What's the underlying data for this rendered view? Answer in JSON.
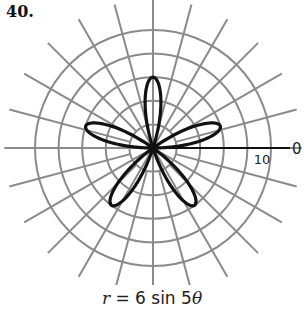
{
  "problem": {
    "number": "40."
  },
  "caption": {
    "lhs": "r",
    "equals": " = 6 sin 5",
    "theta": "θ"
  },
  "axis_labels": {
    "zero_angle": "0",
    "radius_tick": "10"
  },
  "colors": {
    "grid": "#8a8a8a",
    "curve": "#111111",
    "axis": "#111111"
  },
  "chart_data": {
    "type": "polar",
    "title": "r = 6 sin 5θ",
    "equation": {
      "a": 6,
      "k": 5,
      "function": "sin"
    },
    "petals": 5,
    "max_radius": 6,
    "grid": {
      "circles": [
        2,
        4,
        6,
        8,
        10
      ],
      "ray_step_degrees": 15,
      "ray_count": 24
    },
    "labels": [
      {
        "text": "0",
        "position": "angle 0 axis end"
      },
      {
        "text": "10",
        "position": "radius 10 on polar axis"
      }
    ],
    "rlim": [
      0,
      10
    ]
  }
}
